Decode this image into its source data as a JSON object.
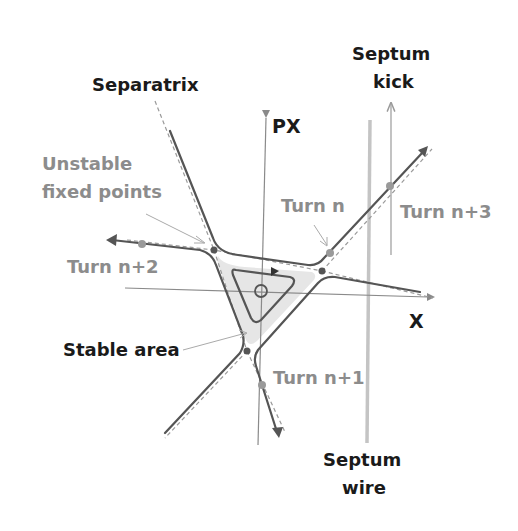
{
  "diagram": {
    "colors": {
      "separatrix": "#555555",
      "dashed": "#9a9a9a",
      "axis": "#8a8a8a",
      "septum_wire": "#c4c4c4",
      "stable_fill": "#e6e6e6",
      "gray_text": "#8c8c8c",
      "dark_text": "#1a1a1a",
      "point": "#555555",
      "turn_point": "#9a9a9a"
    },
    "labels": {
      "separatrix": "Separatrix",
      "unstable_line1": "Unstable",
      "unstable_line2": "fixed points",
      "px_axis": "PX",
      "x_axis": "X",
      "septum_kick_line1": "Septum",
      "septum_kick_line2": "kick",
      "septum_wire_line1": "Septum",
      "septum_wire_line2": "wire",
      "stable_area": "Stable area",
      "turn_n": "Turn n",
      "turn_n1": "Turn n+1",
      "turn_n2": "Turn n+2",
      "turn_n3": "Turn n+3"
    },
    "nodes": [
      {
        "name": "unstable-fixed-point-left",
        "x": 214,
        "y": 250
      },
      {
        "name": "unstable-fixed-point-right",
        "x": 322,
        "y": 271
      },
      {
        "name": "unstable-fixed-point-bottom",
        "x": 247,
        "y": 351
      },
      {
        "name": "turn-n-point",
        "x": 330,
        "y": 253
      },
      {
        "name": "turn-n1-point",
        "x": 262,
        "y": 385
      },
      {
        "name": "turn-n2-point",
        "x": 142,
        "y": 244
      },
      {
        "name": "turn-n3-point",
        "x": 390,
        "y": 186
      }
    ]
  }
}
